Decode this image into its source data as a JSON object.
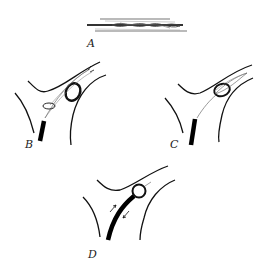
{
  "figure": {
    "panels": [
      {
        "id": "A",
        "label": "A",
        "description": "Stretched mesh / stent device, elongated"
      },
      {
        "id": "B",
        "label": "B",
        "description": "Catheter at vessel bifurcation with loop snare and ring"
      },
      {
        "id": "C",
        "label": "C",
        "description": "Device deployed around ring in vessel branch"
      },
      {
        "id": "D",
        "label": "D",
        "description": "Catheter advanced with ring captured, arrows indicating motion"
      }
    ],
    "colors": {
      "line": "#111111",
      "background": "#ffffff",
      "mesh": "#555555"
    }
  }
}
